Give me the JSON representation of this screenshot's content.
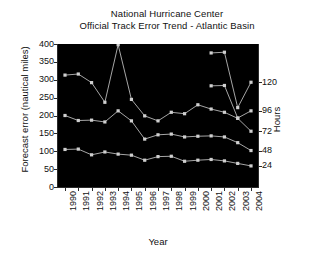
{
  "chart_data": {
    "type": "line",
    "title": "National Hurricane Center\nOfficial Track Error Trend - Atlantic Basin",
    "title_line1": "National Hurricane Center",
    "title_line2": "Official Track Error Trend - Atlantic Basin",
    "xlabel": "Year",
    "ylabel": "Forecast error (nautical miles)",
    "y2label": "Hours",
    "grid": false,
    "legend": "right-axis-endpoint-labels",
    "plot_background": "#000000",
    "line_color": "#b8b8b8",
    "marker_color": "#cfcfcf",
    "ylim": [
      0,
      400
    ],
    "yticks": [
      0,
      50,
      100,
      150,
      200,
      250,
      300,
      350,
      400
    ],
    "y2_endpoint_labels": [
      "24",
      "48",
      "72",
      "96",
      "120"
    ],
    "categories": [
      "1990",
      "1991",
      "1992",
      "1993",
      "1994",
      "1995",
      "1996",
      "1997",
      "1998",
      "1999",
      "2000",
      "2001",
      "2002",
      "2003",
      "2004"
    ],
    "x": [
      1990,
      1991,
      1992,
      1993,
      1994,
      1995,
      1996,
      1997,
      1998,
      1999,
      2000,
      2001,
      2002,
      2003,
      2004
    ],
    "series": [
      {
        "name": "120",
        "hours": 120,
        "x": [
          2001,
          2002,
          2003,
          2004
        ],
        "values": [
          375,
          377,
          222,
          293
        ]
      },
      {
        "name": "96",
        "hours": 96,
        "x": [
          2001,
          2002,
          2003,
          2004
        ],
        "values": [
          283,
          284,
          193,
          213
        ]
      },
      {
        "name": "72",
        "hours": 72,
        "x": [
          1990,
          1991,
          1992,
          1993,
          1994,
          1995,
          1996,
          1997,
          1998,
          1999,
          2000,
          2001,
          2002,
          2003,
          2004
        ],
        "values": [
          313,
          316,
          292,
          237,
          398,
          245,
          199,
          185,
          209,
          205,
          230,
          218,
          209,
          192,
          156
        ]
      },
      {
        "name": "48",
        "hours": 48,
        "x": [
          1990,
          1991,
          1992,
          1993,
          1994,
          1995,
          1996,
          1997,
          1998,
          1999,
          2000,
          2001,
          2002,
          2003,
          2004
        ],
        "values": [
          200,
          186,
          187,
          182,
          213,
          185,
          134,
          146,
          148,
          140,
          142,
          143,
          140,
          124,
          102
        ]
      },
      {
        "name": "24",
        "hours": 24,
        "x": [
          1990,
          1991,
          1992,
          1993,
          1994,
          1995,
          1996,
          1997,
          1998,
          1999,
          2000,
          2001,
          2002,
          2003,
          2004
        ],
        "values": [
          105,
          106,
          90,
          98,
          92,
          89,
          75,
          85,
          86,
          72,
          75,
          77,
          73,
          66,
          59
        ]
      }
    ]
  },
  "axis": {
    "y_title": "Forecast error (nautical miles)",
    "x_title": "Year",
    "right_title": "Hours"
  }
}
